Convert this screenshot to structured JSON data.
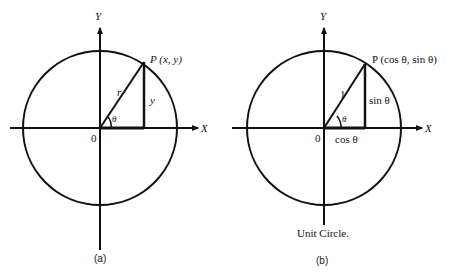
{
  "figures": [
    {
      "id": "a",
      "caption": "(a)",
      "axis_x_label": "X",
      "axis_y_label": "Y",
      "origin_label": "0",
      "point_label": "P (x, y)",
      "hypotenuse_label": "r",
      "vertical_label": "y",
      "angle_label": "θ",
      "subtitle": ""
    },
    {
      "id": "b",
      "caption": "(b)",
      "axis_x_label": "X",
      "axis_y_label": "Y",
      "origin_label": "0",
      "point_label": "P (cos θ, sin θ)",
      "hypotenuse_label": "1",
      "vertical_label": "sin θ",
      "horizontal_label": "cos θ",
      "angle_label": "θ",
      "subtitle": "Unit Circle."
    }
  ]
}
